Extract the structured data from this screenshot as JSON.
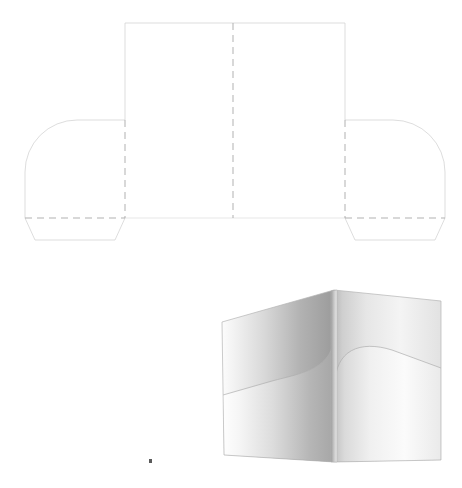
{
  "document": {
    "title": "Presentation Folder Dieline and 3D Preview",
    "background_color": "#ffffff",
    "width": 462,
    "height": 488
  },
  "dieline": {
    "label": "Folder flat dieline (top drawing)",
    "cut_line_color": "#c8c8c8",
    "fold_line_color": "#a8a8a8",
    "cut_line_style": "solid",
    "fold_line_style": "dashed",
    "stroke_width": 0.7,
    "dash_pattern": "7,5",
    "geometry": {
      "panel_left_x": 125,
      "panel_right_x": 345,
      "panel_top_y": 23,
      "panel_bottom_y": 218,
      "center_fold_x": 233,
      "pocket_fold_y": 218,
      "left_flap_outer_x": 25,
      "right_flap_outer_x": 445,
      "flap_top_y": 120,
      "flap_corner_radius": 52,
      "flap_bottom_y": 240,
      "flap_taper": 10
    },
    "parts": [
      {
        "name": "front-panel",
        "label": "Front panel"
      },
      {
        "name": "back-panel",
        "label": "Back panel"
      },
      {
        "name": "left-pocket-flap",
        "label": "Left pocket flap"
      },
      {
        "name": "right-pocket-flap",
        "label": "Right pocket flap"
      },
      {
        "name": "center-fold",
        "label": "Center spine fold"
      },
      {
        "name": "pocket-fold",
        "label": "Pocket fold line"
      }
    ]
  },
  "preview": {
    "label": "Folder 3D perspective preview (bottom drawing)",
    "outline_color": "#b4b4b4",
    "stroke_width": 0.7,
    "shading": {
      "left_panel_light": "#fbfbfb",
      "left_panel_dark": "#9a9a9a",
      "left_pocket_light": "#fdfdfd",
      "left_pocket_dark": "#a5a5a5",
      "right_panel_light": "#ffffff",
      "right_panel_dark": "#d2d2d2",
      "right_pocket_light": "#ffffff",
      "right_pocket_dark": "#c0c0c0",
      "spine_color": "#cfcfcf"
    },
    "geometry": {
      "spine_top_x": 334,
      "spine_top_y": 290,
      "spine_bottom_x": 334,
      "spine_bottom_y": 462,
      "left_outer_top_x": 222,
      "left_outer_top_y": 322,
      "left_outer_bottom_y": 455,
      "right_outer_x": 441,
      "right_outer_top_y": 301,
      "right_outer_bottom_y": 460,
      "pocket_radius": 46
    }
  },
  "artifact": {
    "name": "stray-mark",
    "x": 150,
    "y": 461,
    "color": "#5a5a5a"
  }
}
